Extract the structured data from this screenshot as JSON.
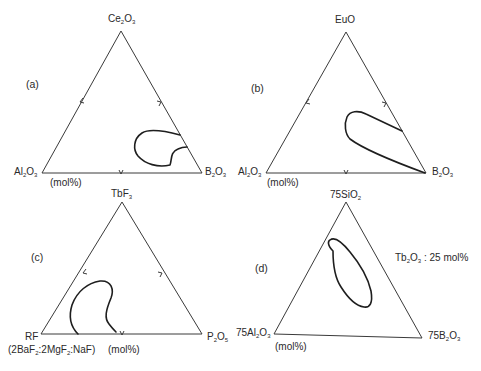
{
  "panels": {
    "a": {
      "tag": "(a)",
      "top": {
        "pre": "Ce",
        "s1": "2",
        "mid": "O",
        "s2": "3"
      },
      "left": {
        "pre": "Al",
        "s1": "2",
        "mid": "O",
        "s2": "3"
      },
      "right": {
        "pre": "B",
        "s1": "2",
        "mid": "O",
        "s2": "3"
      },
      "unit": "(mol%)"
    },
    "b": {
      "tag": "(b)",
      "top": {
        "pre": "EuO",
        "s1": "",
        "mid": "",
        "s2": ""
      },
      "left": {
        "pre": "Al",
        "s1": "2",
        "mid": "O",
        "s2": "3"
      },
      "right": {
        "pre": "B",
        "s1": "2",
        "mid": "O",
        "s2": "3"
      },
      "unit": "(mol%)"
    },
    "c": {
      "tag": "(c)",
      "top": {
        "pre": "TbF",
        "s1": "3",
        "mid": "",
        "s2": ""
      },
      "left": {
        "pre": "RF",
        "s1": "",
        "mid": "",
        "s2": ""
      },
      "left_note": {
        "p1": "(2BaF",
        "s1": "2",
        "p2": ":2MgF",
        "s2": "2",
        "p3": ":NaF)"
      },
      "right": {
        "pre": "P",
        "s1": "2",
        "mid": "O",
        "s2": "5"
      },
      "unit": "(mol%)"
    },
    "d": {
      "tag": "(d)",
      "top": {
        "pre": "75SiO",
        "s1": "2",
        "mid": "",
        "s2": ""
      },
      "left": {
        "pre": "75Al",
        "s1": "2",
        "mid": "O",
        "s2": "3"
      },
      "right": {
        "pre": "75B",
        "s1": "2",
        "mid": "O",
        "s2": "3"
      },
      "note": {
        "pre": "Tb",
        "s1": "2",
        "mid": "O",
        "s2": "3",
        "post": " : 25 mol%"
      },
      "unit": "(mol%)"
    }
  },
  "colors": {
    "line": "#3a3a3a",
    "curve": "#1e1e1e",
    "background": "#ffffff"
  }
}
